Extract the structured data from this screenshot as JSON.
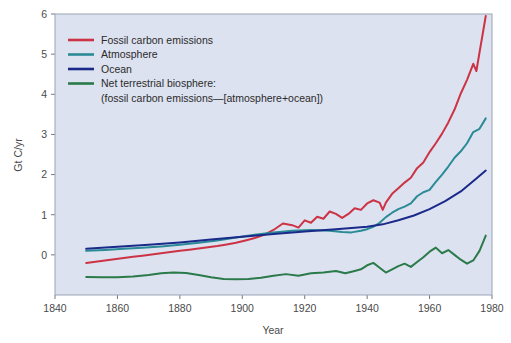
{
  "chart_data": {
    "type": "line",
    "title": "",
    "xlabel": "Year",
    "ylabel": "Gt C/yr",
    "xlim": [
      1840,
      1980
    ],
    "ylim": [
      -1.0,
      6.0
    ],
    "xticks": [
      1840,
      1860,
      1880,
      1900,
      1920,
      1940,
      1960,
      1980
    ],
    "yticks": [
      0,
      1,
      2,
      3,
      4,
      5,
      6
    ],
    "grid": false,
    "legend_position": "top-left",
    "series": [
      {
        "name": "Fossil carbon emissions",
        "color": "#cc3344",
        "x": [
          1850,
          1853,
          1856,
          1859,
          1862,
          1865,
          1868,
          1871,
          1874,
          1877,
          1880,
          1883,
          1886,
          1889,
          1892,
          1895,
          1898,
          1901,
          1904,
          1907,
          1910,
          1913,
          1916,
          1918,
          1920,
          1922,
          1924,
          1926,
          1928,
          1930,
          1932,
          1934,
          1936,
          1938,
          1940,
          1942,
          1944,
          1945,
          1946,
          1948,
          1950,
          1952,
          1954,
          1956,
          1958,
          1960,
          1962,
          1964,
          1966,
          1968,
          1970,
          1972,
          1974,
          1975,
          1976,
          1978
        ],
        "y": [
          -0.2,
          -0.17,
          -0.14,
          -0.11,
          -0.08,
          -0.05,
          -0.02,
          0.01,
          0.04,
          0.07,
          0.1,
          0.13,
          0.16,
          0.19,
          0.22,
          0.26,
          0.3,
          0.36,
          0.42,
          0.5,
          0.62,
          0.78,
          0.74,
          0.68,
          0.86,
          0.8,
          0.95,
          0.9,
          1.08,
          1.02,
          0.92,
          1.02,
          1.16,
          1.12,
          1.28,
          1.36,
          1.3,
          1.12,
          1.3,
          1.52,
          1.66,
          1.8,
          1.92,
          2.16,
          2.3,
          2.56,
          2.78,
          3.02,
          3.3,
          3.62,
          4.02,
          4.36,
          4.76,
          4.58,
          5.04,
          5.95
        ]
      },
      {
        "name": "Atmosphere",
        "color": "#2a8a96",
        "x": [
          1850,
          1856,
          1862,
          1868,
          1874,
          1880,
          1886,
          1892,
          1898,
          1904,
          1910,
          1916,
          1922,
          1928,
          1932,
          1935,
          1938,
          1940,
          1942,
          1944,
          1946,
          1948,
          1950,
          1952,
          1954,
          1956,
          1958,
          1960,
          1962,
          1964,
          1966,
          1968,
          1970,
          1972,
          1974,
          1976,
          1978
        ],
        "y": [
          0.1,
          0.12,
          0.15,
          0.18,
          0.21,
          0.25,
          0.3,
          0.36,
          0.43,
          0.5,
          0.56,
          0.6,
          0.62,
          0.6,
          0.57,
          0.56,
          0.6,
          0.64,
          0.7,
          0.8,
          0.94,
          1.05,
          1.14,
          1.2,
          1.28,
          1.46,
          1.56,
          1.62,
          1.82,
          2.0,
          2.2,
          2.42,
          2.58,
          2.78,
          3.06,
          3.14,
          3.4
        ]
      },
      {
        "name": "Ocean",
        "color": "#1a2a8a",
        "x": [
          1850,
          1860,
          1870,
          1880,
          1890,
          1900,
          1910,
          1920,
          1930,
          1940,
          1945,
          1950,
          1955,
          1960,
          1965,
          1970,
          1975,
          1978
        ],
        "y": [
          0.15,
          0.2,
          0.25,
          0.31,
          0.38,
          0.45,
          0.52,
          0.58,
          0.64,
          0.7,
          0.76,
          0.86,
          0.98,
          1.14,
          1.34,
          1.58,
          1.9,
          2.1
        ]
      },
      {
        "name": "Net terrestrial biosphere: (fossil carbon emissions—[atmosphere+ocean])",
        "color": "#2a7a4a",
        "x": [
          1850,
          1855,
          1860,
          1865,
          1870,
          1874,
          1878,
          1882,
          1886,
          1890,
          1894,
          1898,
          1902,
          1906,
          1910,
          1914,
          1918,
          1922,
          1926,
          1930,
          1933,
          1936,
          1938,
          1940,
          1942,
          1944,
          1946,
          1948,
          1950,
          1952,
          1954,
          1956,
          1958,
          1960,
          1962,
          1964,
          1966,
          1968,
          1970,
          1972,
          1974,
          1976,
          1978
        ],
        "y": [
          -0.55,
          -0.56,
          -0.56,
          -0.54,
          -0.5,
          -0.46,
          -0.44,
          -0.45,
          -0.5,
          -0.56,
          -0.6,
          -0.61,
          -0.6,
          -0.57,
          -0.52,
          -0.48,
          -0.52,
          -0.46,
          -0.44,
          -0.4,
          -0.46,
          -0.4,
          -0.36,
          -0.26,
          -0.2,
          -0.32,
          -0.44,
          -0.36,
          -0.28,
          -0.22,
          -0.3,
          -0.18,
          -0.06,
          0.08,
          0.18,
          0.04,
          0.12,
          0.0,
          -0.12,
          -0.22,
          -0.14,
          0.1,
          0.48
        ]
      }
    ]
  },
  "legend": {
    "entries": [
      {
        "label": "Fossil carbon emissions",
        "color": "#cc3344"
      },
      {
        "label": "Atmosphere",
        "color": "#2a8a96"
      },
      {
        "label": "Ocean",
        "color": "#1a2a8a"
      },
      {
        "label": "Net terrestrial biosphere:",
        "color": "#2a7a4a"
      }
    ],
    "sub_label": "(fossil carbon emissions—[atmosphere+ocean])"
  },
  "axes": {
    "y_title": "Gt C/yr",
    "x_title": "Year",
    "x_tick_labels": [
      "1840",
      "1860",
      "1880",
      "1900",
      "1920",
      "1940",
      "1960",
      "1980"
    ],
    "y_tick_labels": [
      "0",
      "1",
      "2",
      "3",
      "4",
      "5",
      "6"
    ]
  },
  "colors": {
    "plot_background": "#dde2f0",
    "page_background": "#ffffff",
    "axis": "#9aa3b5",
    "text": "#4a4a4a"
  }
}
